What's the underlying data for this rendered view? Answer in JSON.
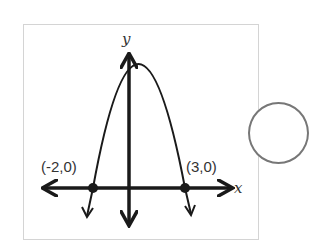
{
  "figure": {
    "type": "parabola-graph",
    "axis_labels": {
      "x": "x",
      "y": "y"
    },
    "points": [
      {
        "label": "(-2,0)",
        "x": -2,
        "y": 0
      },
      {
        "label": "(3,0)",
        "x": 3,
        "y": 0
      }
    ],
    "curve": "downward-opening parabola through (-2,0) and (3,0)",
    "colors": {
      "ink": "#1a1a1a",
      "frame": "#d4d4d4",
      "circle": "#777777"
    }
  },
  "answer_choice": {
    "shape": "circle",
    "selected": false
  }
}
